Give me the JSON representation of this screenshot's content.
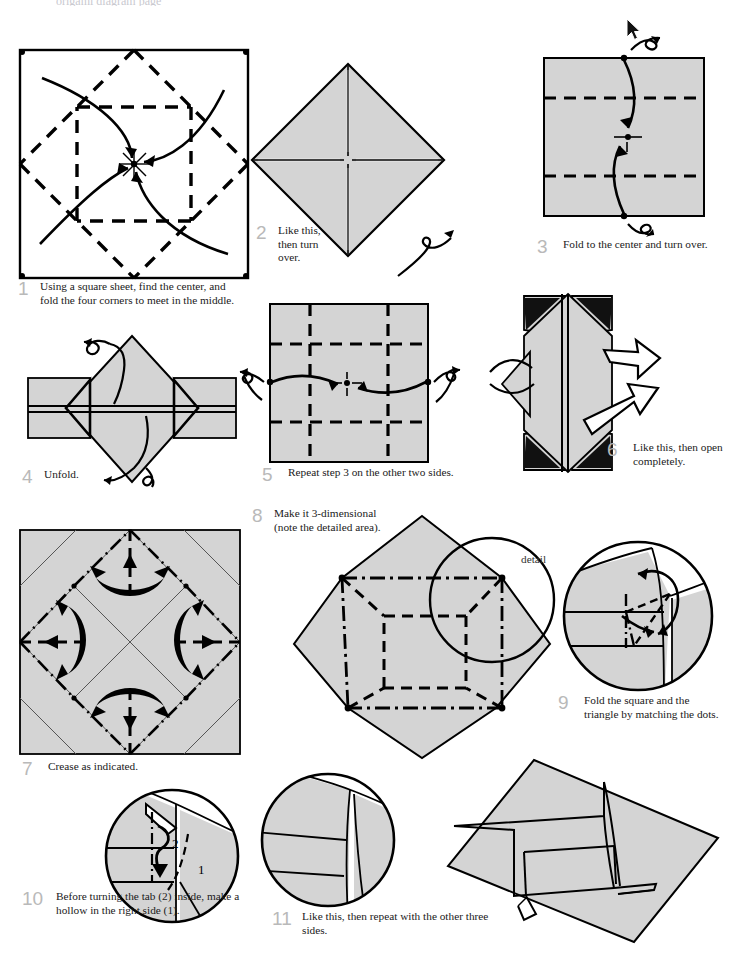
{
  "document": {
    "kind": "origami-instruction-sheet",
    "title_cropped": "origami diagram page",
    "paper_fill": "#d4d4d4",
    "line_color": "#000000",
    "caption_color": "#1a1a1a",
    "number_color": "#b9b9b9",
    "background": "#ffffff"
  },
  "detail_callout": {
    "label": "detail"
  },
  "steps": [
    {
      "number": "1",
      "text": "Using a square sheet, find the center, and fold the four corners to meet in the middle.",
      "figure": "square-with-diagonal-valley-creases-and-four-curved-arrows-to-center"
    },
    {
      "number": "2",
      "text": "Like this, then turn over.",
      "figure": "diamond-blintz-with-cross-seams"
    },
    {
      "number": "3",
      "text": "Fold to the center and turn over.",
      "figure": "square-with-two-horizontal-dashed-creases-and-two-vertical-arrows"
    },
    {
      "number": "4",
      "text": "Unfold.",
      "figure": "diamond-with-side-flaps-and-unfold-arrows"
    },
    {
      "number": "5",
      "text": "Repeat step 3 on the other two sides.",
      "figure": "square-grid-of-dashed-creases-with-two-horizontal-arrows"
    },
    {
      "number": "6",
      "text": "Like this, then open completely.",
      "figure": "folded-form-with-hollow-open-arrows"
    },
    {
      "number": "7",
      "text": "Crease as indicated.",
      "figure": "square-crease-pattern-with-dash-dot-diagonals-and-four-push-arrows"
    },
    {
      "number": "8",
      "text": "Make it 3-dimensional (note the detailed area).",
      "figure": "octagonal-3d-box-with-dashed-and-dash-dot-edges-plus-detail-circle"
    },
    {
      "number": "9",
      "text": "Fold the square and the triangle by matching the dots.",
      "figure": "circular-detail-with-dashed-triangle-and-two-curved-arrows"
    },
    {
      "number": "10",
      "text": "Before turning the tab (2) inside, make a hollow in the right side (1).",
      "figure": "circular-detail-with-tab-arrows",
      "labels": [
        "1",
        "2"
      ]
    },
    {
      "number": "11",
      "text": "Like this, then repeat with the other three sides.",
      "figure": "circular-detail-of-finished-corner"
    }
  ],
  "final_figure": {
    "name": "finished-model-diamond-view",
    "description": "completed stepped model seen as a diamond"
  }
}
